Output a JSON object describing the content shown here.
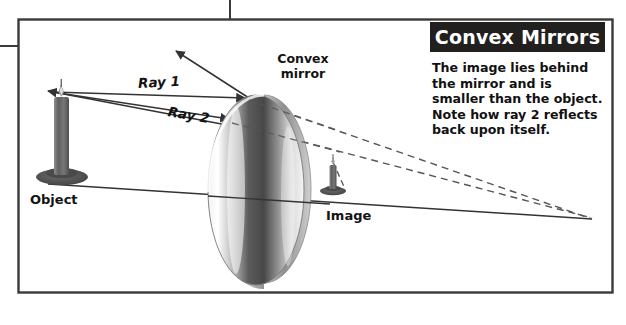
{
  "figure": {
    "type": "optics-ray-diagram",
    "panel_title": "Convex Mirrors",
    "caption": "The image lies behind the mirror and is smaller than the object. Note how ray 2 reflects back upon itself.",
    "labels": {
      "mirror": "Convex\nmirror",
      "mirror_line1": "Convex",
      "mirror_line2": "mirror",
      "object": "Object",
      "image": "Image",
      "ray1": "Ray 1",
      "ray2": "Ray 2"
    },
    "colors": {
      "title_bar_bg": "#221f1f",
      "title_text": "#ffffff",
      "body_text": "#111111",
      "line": "#333333",
      "dashed_line": "#555555",
      "border": "#3a3a3a",
      "mirror_light": "#ffffff",
      "mirror_dark": "#4a4a4a",
      "candle_body": "#6b6b6b"
    }
  }
}
